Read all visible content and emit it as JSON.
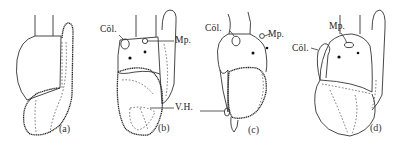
{
  "figure": {
    "panels": [
      {
        "id": "a",
        "caption": "(a)"
      },
      {
        "id": "b",
        "caption": "(b)"
      },
      {
        "id": "c",
        "caption": "(c)"
      },
      {
        "id": "d",
        "caption": "(d)"
      }
    ],
    "labels": {
      "b_col": "Cöl.",
      "b_mp": "Mp.",
      "b_vh": "V.H.",
      "c_col": "Cöl.",
      "c_mp": "Mp.",
      "d_col": "Cöl.",
      "d_mp": "Mp."
    },
    "colors": {
      "ink": "#222222",
      "background": "#ffffff"
    }
  }
}
